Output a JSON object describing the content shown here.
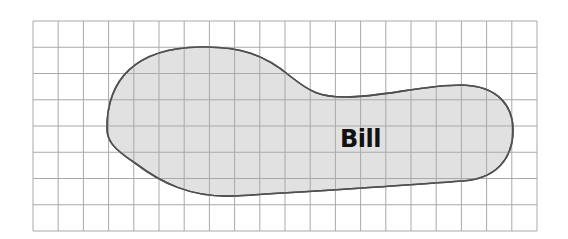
{
  "diagram": {
    "type": "area-on-grid",
    "grid": {
      "columns": 20,
      "rows": 8,
      "left": 33,
      "top": 21,
      "right": 537,
      "bottom": 231,
      "line_color": "#a9a9a9"
    },
    "shape": {
      "label": "Bill",
      "fill_color": "#dcdcdc",
      "stroke_color": "#505050"
    }
  }
}
